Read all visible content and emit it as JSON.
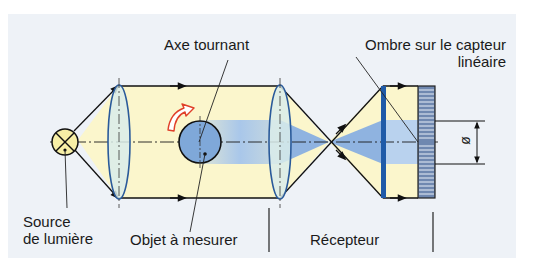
{
  "labels": {
    "axe_tournant": "Axe tournant",
    "ombre_line1": "Ombre sur le capteur",
    "ombre_line2": "linéaire",
    "source_line1": "Source",
    "source_line2": "de lumière",
    "objet": "Objet à mesurer",
    "recepteur": "Récepteur",
    "diameter_symbol": "ø"
  },
  "colors": {
    "panel_bg": "#eef2f7",
    "beam_yellow": "#fbf6cc",
    "shadow_blue": "#a9c7ea",
    "object_blue": "#7fa8d9",
    "lens_fill": "#d9ecea",
    "lens_stroke": "#2a5a9a",
    "receptor_blue": "#1f5ba8",
    "rotation_arrow": "#e0402a",
    "line": "#111111"
  },
  "components": [
    {
      "id": "light-source",
      "label": "Source de lumière"
    },
    {
      "id": "collimator-lens",
      "label": ""
    },
    {
      "id": "object",
      "label": "Objet à mesurer"
    },
    {
      "id": "focusing-lens",
      "label": ""
    },
    {
      "id": "receiver",
      "label": "Récepteur"
    },
    {
      "id": "linear-sensor",
      "label": "Ombre sur le capteur linéaire"
    }
  ]
}
